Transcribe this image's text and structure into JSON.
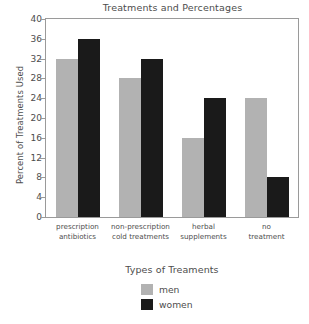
{
  "chart_data": {
    "type": "bar",
    "title": "Treatments and Percentages",
    "xlabel": "Types of Treaments",
    "ylabel": "Percent of Treatments Used",
    "categories": [
      "prescription antibiotics",
      "non-prescription cold treatments",
      "herbal supplements",
      "no treatment"
    ],
    "category_lines": [
      [
        "prescription",
        "antibiotics"
      ],
      [
        "non-prescription",
        "cold treatments"
      ],
      [
        "herbal",
        "supplements"
      ],
      [
        "no",
        "treatment"
      ]
    ],
    "series": [
      {
        "name": "men",
        "values": [
          32,
          28,
          16,
          24
        ],
        "color": "#b2b2b2"
      },
      {
        "name": "women",
        "values": [
          36,
          32,
          24,
          8
        ],
        "color": "#1a1a1a"
      }
    ],
    "ylim": [
      0,
      40
    ],
    "yticks": [
      0,
      4,
      8,
      12,
      16,
      20,
      24,
      28,
      32,
      36,
      40
    ],
    "ytick_labels": [
      "0",
      "4",
      "8",
      "12",
      "16",
      "20",
      "24",
      "28",
      "32",
      "36",
      "40"
    ],
    "grid": false,
    "legend_position": "bottom",
    "legend": [
      {
        "label": "men",
        "color": "#b2b2b2"
      },
      {
        "label": "women",
        "color": "#1a1a1a"
      }
    ],
    "frame_color": "#9a9a9a",
    "text_color": "#4d4d4d",
    "background": "#ffffff"
  }
}
